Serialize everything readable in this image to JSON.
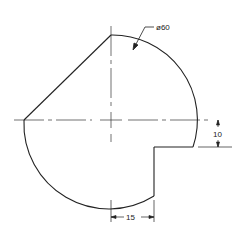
{
  "drawing": {
    "colors": {
      "line": "#222222",
      "background": "#ffffff"
    },
    "dimensions": {
      "diameter": "ø60",
      "notch_height": "10",
      "notch_width": "15"
    }
  }
}
